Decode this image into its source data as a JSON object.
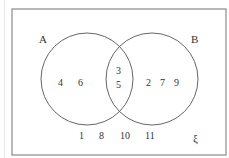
{
  "diagram": {
    "type": "venn",
    "universal_set_symbol": "ξ",
    "sets": [
      {
        "label": "A",
        "only": [
          "4",
          "6"
        ]
      },
      {
        "label": "B",
        "only": [
          "2",
          "7",
          "9"
        ]
      }
    ],
    "intersection": [
      "3",
      "5"
    ],
    "outside": [
      "1",
      "8",
      "10",
      "11"
    ],
    "colors": {
      "stroke": "#555555",
      "text": "#333333",
      "frame": "#888888"
    }
  }
}
